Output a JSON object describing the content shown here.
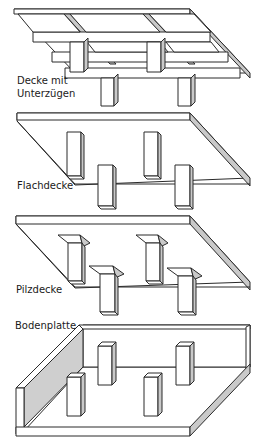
{
  "diagram": {
    "panels": [
      {
        "id": "decke-mit-unterzuegen",
        "label_line1": "Decke mit",
        "label_line2": "Unterzügen"
      },
      {
        "id": "flachdecke",
        "label": "Flachdecke"
      },
      {
        "id": "pilzdecke",
        "label": "Pilzdecke"
      },
      {
        "id": "bodenplatte",
        "label": "Bodenplatte"
      }
    ],
    "colors": {
      "line": "#2a2a2a",
      "shade": "#c9c9c9",
      "background": "#ffffff"
    }
  }
}
